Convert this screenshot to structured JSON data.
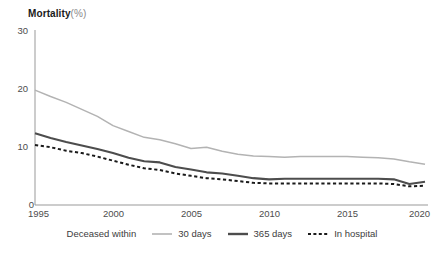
{
  "chart_data": {
    "type": "line",
    "title_main": "Mortality",
    "title_unit": "(%)",
    "xlabel": "",
    "ylabel": "Mortality (%)",
    "xlim": [
      1995,
      2020
    ],
    "ylim": [
      0,
      30
    ],
    "grid": false,
    "legend_position": "bottom",
    "legend_caption": "Deceased within",
    "x_ticks": [
      "1995",
      "2000",
      "2005",
      "2010",
      "2015",
      "2020"
    ],
    "y_ticks": [
      "0",
      "10",
      "20",
      "30"
    ],
    "x": [
      1995,
      1996,
      1997,
      1998,
      1999,
      2000,
      2001,
      2002,
      2003,
      2004,
      2005,
      2006,
      2007,
      2008,
      2009,
      2010,
      2011,
      2012,
      2013,
      2014,
      2015,
      2016,
      2017,
      2018,
      2019,
      2020
    ],
    "series": [
      {
        "name": "30 days",
        "color": "#b3b3b3",
        "style": "solid",
        "values": [
          19.7,
          18.6,
          17.6,
          16.4,
          15.2,
          13.6,
          12.6,
          11.6,
          11.2,
          10.5,
          9.7,
          9.9,
          9.2,
          8.7,
          8.4,
          8.3,
          8.2,
          8.3,
          8.3,
          8.3,
          8.3,
          8.2,
          8.1,
          7.9,
          7.4,
          7.0
        ]
      },
      {
        "name": "365 days",
        "color": "#4d4d4d",
        "style": "solid",
        "values": [
          12.3,
          11.5,
          10.8,
          10.2,
          9.6,
          8.9,
          8.1,
          7.5,
          7.3,
          6.5,
          6.1,
          5.6,
          5.4,
          5.0,
          4.6,
          4.4,
          4.5,
          4.5,
          4.5,
          4.5,
          4.5,
          4.5,
          4.5,
          4.4,
          3.6,
          4.0
        ]
      },
      {
        "name": "In hospital",
        "color": "#1a1a1a",
        "style": "dashed",
        "values": [
          10.3,
          9.9,
          9.3,
          8.9,
          8.3,
          7.6,
          6.9,
          6.3,
          6.0,
          5.4,
          5.0,
          4.6,
          4.4,
          4.1,
          3.8,
          3.7,
          3.7,
          3.7,
          3.7,
          3.7,
          3.7,
          3.7,
          3.7,
          3.6,
          3.2,
          3.3
        ]
      }
    ]
  },
  "axes": {
    "axis_color": "#999999",
    "label_color": "#4d4d4d"
  }
}
